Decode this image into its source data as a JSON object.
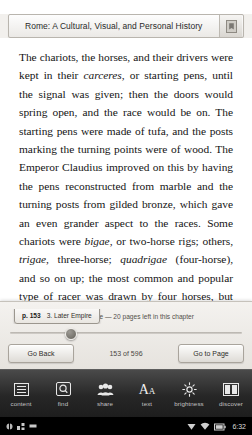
{
  "titlebar": {
    "book_title": "Rome: A Cultural, Visual, and Personal History",
    "bookmark_icon": "bookmark-icon"
  },
  "page": {
    "paragraphs": [
      {
        "runs": [
          {
            "text": "The chariots, the horses, and their drivers were kept in their ",
            "style": "normal"
          },
          {
            "text": "carceres",
            "style": "italic"
          },
          {
            "text": ", or starting pens, until the signal was given; then the doors would spring open, and the race would be on. The starting pens were made of tufa, and the posts marking the turning points were of wood. The Emperor Claudius improved on this by having the pens reconstructed from marble and the turning posts from gilded bronze, which gave an even grander aspect to the races. Some chariots were ",
            "style": "normal"
          },
          {
            "text": "bigae",
            "style": "italic"
          },
          {
            "text": ", or two-horse rigs; others, ",
            "style": "normal"
          },
          {
            "text": "trigae",
            "style": "italic"
          },
          {
            "text": ", three-horse; ",
            "style": "normal"
          },
          {
            "text": "quadrigae",
            "style": "italic"
          },
          {
            "text": " (four-horse), and so on up; the most common and popular type of racer was drawn by four horses, but eight-horse chariots were not unknown.",
            "style": "normal"
          }
        ]
      },
      {
        "runs": [
          {
            "text": "The charioteers commonly began as slaves, and could win their freedom through",
            "style": "normal"
          }
        ]
      }
    ]
  },
  "overlay": {
    "tooltip": {
      "page_label": "p. 153",
      "chapter_label": "3. Later Empire"
    },
    "chapter_status": "3. Later Empire — 20 pages left in this chapter",
    "slider_position_percent": 26,
    "go_back_label": "Go Back",
    "page_count_label": "153 of 596",
    "go_to_page_label": "Go to Page"
  },
  "toolbar": {
    "items": [
      {
        "label": "content",
        "icon": "list-lines-icon"
      },
      {
        "label": "find",
        "icon": "magnifier-icon"
      },
      {
        "label": "share",
        "icon": "people-group-icon"
      },
      {
        "label": "text",
        "icon": "aa-text-size-icon"
      },
      {
        "label": "brightness",
        "icon": "sun-icon"
      },
      {
        "label": "discover",
        "icon": "two-panels-icon"
      }
    ]
  },
  "statusbar": {
    "time": "6:32",
    "left_icons": [
      "usb-icon",
      "sync-icon",
      "sd-card-icon"
    ],
    "right_icons": [
      "signal-icon",
      "wifi-icon",
      "battery-icon"
    ]
  },
  "colors": {
    "page_background": "#ffffff",
    "text": "#141414",
    "toolbar_background": "#272727",
    "statusbar_background": "#000000",
    "panel_background": "#eeebe6"
  }
}
